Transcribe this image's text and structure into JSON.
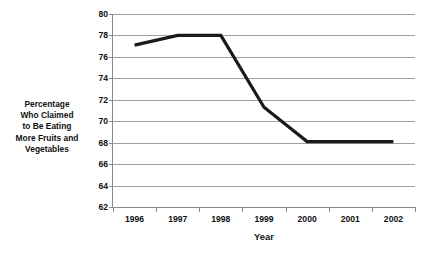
{
  "chart_data": {
    "type": "line",
    "title": "",
    "xlabel": "Year",
    "ylabel": "Percentage Who Claimed to Be Eating More Fruits and Vegetables",
    "ylabel_lines": [
      "Percentage",
      "Who Claimed",
      "to Be Eating",
      "More Fruits and",
      "Vegetables"
    ],
    "categories": [
      "1996",
      "1997",
      "1998",
      "1999",
      "2000",
      "2001",
      "2002"
    ],
    "values": [
      77.1,
      78.0,
      78.0,
      71.3,
      68.1,
      68.1,
      68.1
    ],
    "series": [
      {
        "name": "Percentage Who Claimed to Be Eating More Fruits and Vegetables",
        "values": [
          77.1,
          78.0,
          78.0,
          71.3,
          68.1,
          68.1,
          68.1
        ]
      }
    ],
    "ylim": [
      62,
      80
    ],
    "yticks": [
      80,
      78,
      76,
      74,
      72,
      70,
      68,
      66,
      64,
      62
    ],
    "ytick_labels": [
      "80",
      "78",
      "76",
      "74",
      "72",
      "70",
      "68",
      "66",
      "64",
      "62"
    ],
    "grid": true,
    "legend": false,
    "line_color": "#1a1a1a",
    "grid_color": "#a0a0a0",
    "background_color": "#ffffff"
  }
}
